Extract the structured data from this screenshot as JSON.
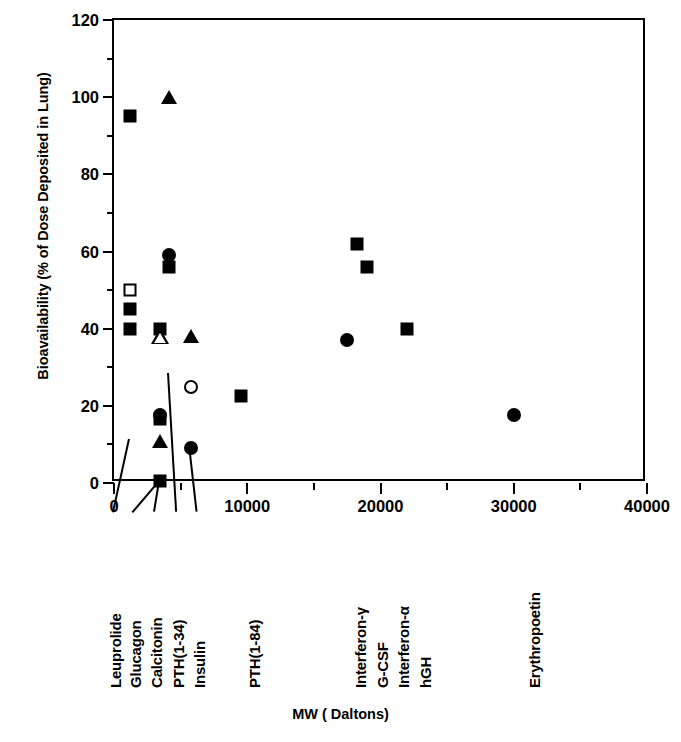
{
  "chart_data": {
    "type": "scatter",
    "title": "",
    "xlabel": "MW ( Daltons)",
    "ylabel": "Bioavailability (% of Dose Deposited in Lung)",
    "xlim": [
      0,
      40000
    ],
    "ylim": [
      0,
      120
    ],
    "xticks": [
      0,
      10000,
      20000,
      30000,
      40000
    ],
    "xtick_labels": [
      "0",
      "10000",
      "20000",
      "30000",
      "40000"
    ],
    "x_minor_step": 5000,
    "yticks": [
      0,
      20,
      40,
      60,
      80,
      100,
      120
    ],
    "ytick_labels": [
      "0",
      "20",
      "40",
      "60",
      "80",
      "100",
      "120"
    ],
    "y_minor_step": 10,
    "grid": false,
    "legend": null,
    "points": [
      {
        "label": "Leuprolide",
        "x": 1209,
        "y": 95,
        "marker": "square",
        "fill": "filled"
      },
      {
        "label": "Leuprolide",
        "x": 1209,
        "y": 50,
        "marker": "square",
        "fill": "open"
      },
      {
        "label": "Leuprolide",
        "x": 1209,
        "y": 45,
        "marker": "square",
        "fill": "filled"
      },
      {
        "label": "Leuprolide",
        "x": 1209,
        "y": 40,
        "marker": "square",
        "fill": "filled"
      },
      {
        "label": "Glucagon",
        "x": 3483,
        "y": 40,
        "marker": "square",
        "fill": "filled"
      },
      {
        "label": "Glucagon",
        "x": 3483,
        "y": 38,
        "marker": "triangle",
        "fill": "open"
      },
      {
        "label": "Calcitonin",
        "x": 3455,
        "y": 17.5,
        "marker": "circle",
        "fill": "filled"
      },
      {
        "label": "Calcitonin",
        "x": 3455,
        "y": 16.5,
        "marker": "square",
        "fill": "filled"
      },
      {
        "label": "Calcitonin",
        "x": 3455,
        "y": 11,
        "marker": "triangle",
        "fill": "filled"
      },
      {
        "label": "Calcitonin",
        "x": 3455,
        "y": 0.5,
        "marker": "square",
        "fill": "filled"
      },
      {
        "label": "PTH(1-34)",
        "x": 4117,
        "y": 100,
        "marker": "triangle",
        "fill": "filled"
      },
      {
        "label": "PTH(1-34)",
        "x": 4117,
        "y": 59,
        "marker": "circle",
        "fill": "filled"
      },
      {
        "label": "PTH(1-34)",
        "x": 4117,
        "y": 56,
        "marker": "square",
        "fill": "filled"
      },
      {
        "label": "Insulin",
        "x": 5808,
        "y": 38,
        "marker": "triangle",
        "fill": "filled"
      },
      {
        "label": "Insulin",
        "x": 5808,
        "y": 25,
        "marker": "circle",
        "fill": "open"
      },
      {
        "label": "Insulin",
        "x": 5808,
        "y": 9,
        "marker": "circle",
        "fill": "filled"
      },
      {
        "label": "PTH(1-84)",
        "x": 9500,
        "y": 22.5,
        "marker": "square",
        "fill": "filled"
      },
      {
        "label": "Interferon-γ",
        "x": 17500,
        "y": 37,
        "marker": "circle",
        "fill": "filled"
      },
      {
        "label": "G-CSF",
        "x": 18200,
        "y": 62,
        "marker": "square",
        "fill": "filled"
      },
      {
        "label": "Interferon-α",
        "x": 19000,
        "y": 56,
        "marker": "square",
        "fill": "filled"
      },
      {
        "label": "hGH",
        "x": 22000,
        "y": 40,
        "marker": "square",
        "fill": "filled"
      },
      {
        "label": "Erythropoetin",
        "x": 30000,
        "y": 17.5,
        "marker": "circle",
        "fill": "filled"
      }
    ],
    "category_labels": [
      {
        "name": "Leuprolide",
        "label_x": 107,
        "leader_from_x": 1209,
        "leader_from_y": 11
      },
      {
        "name": "Glucagon",
        "label_x": 127,
        "leader_from_x": 3483,
        "leader_from_y": 0
      },
      {
        "name": "Calcitonin",
        "label_x": 148,
        "leader_from_x": 3455,
        "leader_from_y": 0
      },
      {
        "name": "PTH(1-34)",
        "label_x": 170,
        "leader_from_x": 4117,
        "leader_from_y": 28
      },
      {
        "name": "Insulin",
        "label_x": 191,
        "leader_from_x": 5808,
        "leader_from_y": 7
      },
      {
        "name": "PTH(1-84)",
        "label_x": 246,
        "leader_from_x": null,
        "leader_from_y": null
      },
      {
        "name": "Interferon-γ",
        "label_x": 352,
        "leader_from_x": null,
        "leader_from_y": null
      },
      {
        "name": "G-CSF",
        "label_x": 374,
        "leader_from_x": null,
        "leader_from_y": null
      },
      {
        "name": "Interferon-α",
        "label_x": 395,
        "leader_from_x": null,
        "leader_from_y": null
      },
      {
        "name": "hGH",
        "label_x": 417,
        "leader_from_x": null,
        "leader_from_y": null
      },
      {
        "name": "Erythropoetin",
        "label_x": 526,
        "leader_from_x": null,
        "leader_from_y": null
      }
    ]
  }
}
